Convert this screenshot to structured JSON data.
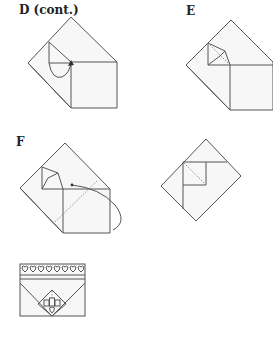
{
  "diagram": {
    "steps": [
      {
        "id": "D",
        "label": "D (cont.)"
      },
      {
        "id": "E",
        "label": "E"
      },
      {
        "id": "F",
        "label": "F"
      },
      {
        "id": "G",
        "label": ""
      },
      {
        "id": "final",
        "label": ""
      }
    ],
    "final_decoration": {
      "heart_count": 8
    }
  }
}
